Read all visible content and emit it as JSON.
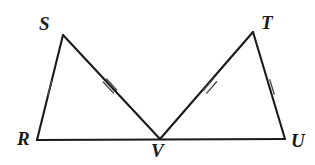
{
  "figure": {
    "kind": "geometry-diagram",
    "background_color": "#ffffff",
    "stroke_color": "#1a1a1a",
    "tick_color": "#4a4a4a",
    "stroke_width": 2.1,
    "tick_width": 1.4,
    "vertices": [
      {
        "name": "R",
        "label": "R",
        "x": 37,
        "y": 140,
        "label_x": 17,
        "label_y": 129
      },
      {
        "name": "S",
        "label": "S",
        "x": 63,
        "y": 35,
        "label_x": 39,
        "label_y": 14
      },
      {
        "name": "V",
        "label": "V",
        "x": 160,
        "y": 139,
        "label_x": 151,
        "label_y": 141
      },
      {
        "name": "T",
        "label": "T",
        "x": 253,
        "y": 32,
        "label_x": 261,
        "label_y": 13
      },
      {
        "name": "U",
        "label": "U",
        "x": 285,
        "y": 139,
        "label_x": 291,
        "label_y": 131
      }
    ],
    "segments": [
      {
        "name": "RS",
        "from": "R",
        "to": "S",
        "x1": 37,
        "y1": 140,
        "x2": 63,
        "y2": 35,
        "ticks": 1
      },
      {
        "name": "SV",
        "from": "S",
        "to": "V",
        "x1": 63,
        "y1": 35,
        "x2": 160,
        "y2": 139,
        "ticks": 2
      },
      {
        "name": "VT",
        "from": "V",
        "to": "T",
        "x1": 160,
        "y1": 139,
        "x2": 253,
        "y2": 32,
        "ticks": 2
      },
      {
        "name": "TU",
        "from": "T",
        "to": "U",
        "x1": 253,
        "y1": 32,
        "x2": 285,
        "y2": 139,
        "ticks": 1
      },
      {
        "name": "RU",
        "from": "R",
        "to": "U",
        "x1": 37,
        "y1": 140,
        "x2": 285,
        "y2": 139,
        "ticks": 0
      }
    ],
    "tick_marks": [
      {
        "name": "tick-RS",
        "segment": "RS",
        "count": 1,
        "cx": 50,
        "cy": 88,
        "angle_deg": 284,
        "length": 15,
        "spacing": 4
      },
      {
        "name": "tick-SV",
        "segment": "SV",
        "count": 2,
        "cx": 110,
        "cy": 86,
        "angle_deg": 47,
        "length": 15,
        "spacing": 4.5
      },
      {
        "name": "tick-VT",
        "segment": "VT",
        "count": 2,
        "cx": 210,
        "cy": 86,
        "angle_deg": 131,
        "length": 15,
        "spacing": 4.5
      },
      {
        "name": "tick-TU",
        "segment": "TU",
        "count": 1,
        "cx": 272,
        "cy": 87,
        "angle_deg": 73,
        "length": 15,
        "spacing": 4
      }
    ]
  }
}
